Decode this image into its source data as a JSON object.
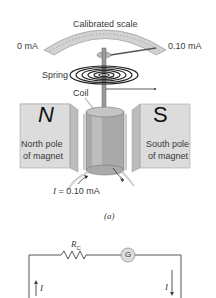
{
  "figure": {
    "labels": {
      "scale": "Calibrated scale",
      "scale_min": "0 mA",
      "scale_max": "0.10 mA",
      "spring": "Spring",
      "coil": "Coil",
      "north_letter": "N",
      "south_letter": "S",
      "north_line1": "North pole",
      "north_line2": "of magnet",
      "south_line1": "South pole",
      "south_line2": "of magnet",
      "current_symbol": "I",
      "current_value": " = 0.10 mA",
      "caption": "(a)"
    },
    "circuit": {
      "resistor_label": "R",
      "resistor_subscript": "C",
      "galvanometer_symbol": "G",
      "left_current": "I",
      "right_current": "I"
    },
    "colors": {
      "magnet": "#d8d8d8",
      "magnet_dark": "#b8b8b8",
      "coil": "#a8a8a8",
      "wire": "#444444",
      "galvanometer_fill": "#dddddd"
    }
  }
}
